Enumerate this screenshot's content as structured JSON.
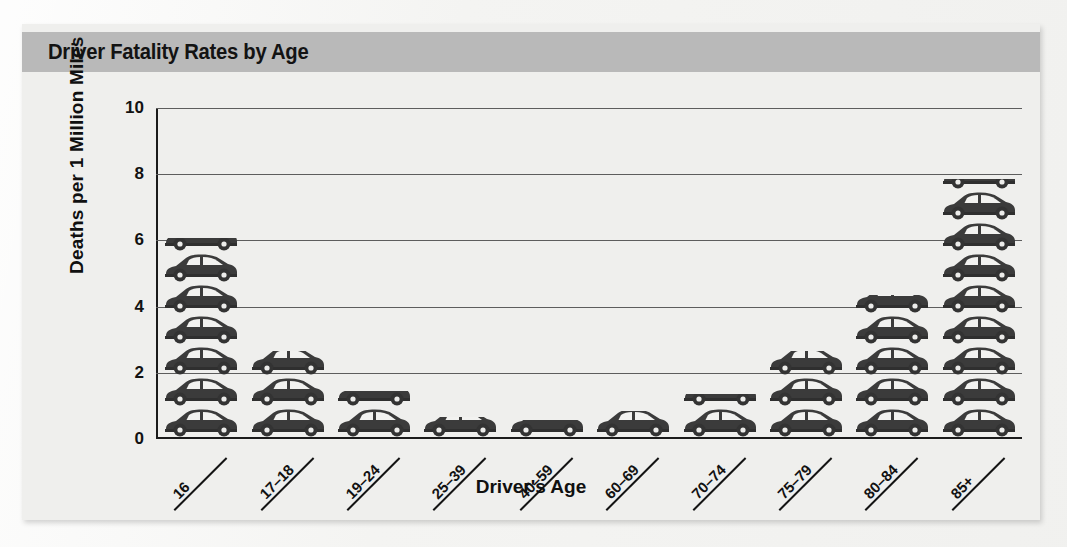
{
  "figure": {
    "title": "Driver Fatality Rates by Age"
  },
  "chart_data": {
    "type": "bar",
    "title": "Driver Fatality Rates by Age",
    "xlabel": "Driver's Age",
    "ylabel": "Deaths per 1 Million Miles",
    "categories": [
      "16",
      "17–18",
      "19–24",
      "25–39",
      "40–59",
      "60–69",
      "70–74",
      "75–79",
      "80–84",
      "85+"
    ],
    "values": [
      6.0,
      2.6,
      1.4,
      0.6,
      0.5,
      0.8,
      1.3,
      2.6,
      4.3,
      7.8
    ],
    "pictogram_counts": [
      8,
      4,
      2,
      1,
      1,
      1,
      2,
      4,
      6,
      10
    ],
    "ylim": [
      0,
      10
    ],
    "yticks": [
      "0",
      "2",
      "4",
      "6",
      "8",
      "10"
    ],
    "ytick_values": [
      0,
      2,
      4,
      6,
      8,
      10
    ],
    "grid": true,
    "grid_orientation": "horizontal",
    "legend": "none",
    "marker_style": "car-pictogram",
    "colors": {
      "banner": "#b9b9b9",
      "plot_background": "#efefed",
      "bar": "#3a3a3a",
      "axis": "#1b1b1b",
      "grid": "#5d5d5d",
      "text": "#121212"
    }
  }
}
